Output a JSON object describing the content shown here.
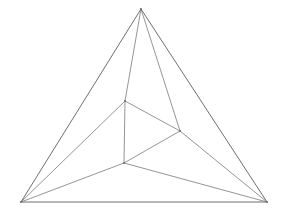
{
  "figure": {
    "type": "line-drawing",
    "background_color": "#ffffff",
    "canvas": {
      "width": 283,
      "height": 213
    },
    "stroke": {
      "color": "#6e6e6e",
      "outer_color": "#5f5f5f",
      "inner_color": "#7a7a7a",
      "width_outer": 0.9,
      "width_inner": 0.8
    },
    "vertices": [
      {
        "id": "apex",
        "name": "outer-apex",
        "x": 141,
        "y": 9
      },
      {
        "id": "bottom_left",
        "name": "outer-bottom-left",
        "x": 21,
        "y": 202
      },
      {
        "id": "bottom_right",
        "name": "outer-bottom-right",
        "x": 267,
        "y": 202
      },
      {
        "id": "inner_top",
        "name": "inner-top",
        "x": 125,
        "y": 101
      },
      {
        "id": "inner_right",
        "name": "inner-right",
        "x": 180,
        "y": 131
      },
      {
        "id": "inner_bottom",
        "name": "inner-bottom",
        "x": 124,
        "y": 163
      }
    ],
    "edges": [
      {
        "id": "outer-left-side",
        "from": "apex",
        "to": "bottom_left",
        "group": "outer"
      },
      {
        "id": "outer-right-side",
        "from": "apex",
        "to": "bottom_right",
        "group": "outer"
      },
      {
        "id": "outer-base",
        "from": "bottom_left",
        "to": "bottom_right",
        "group": "outer"
      },
      {
        "id": "inner-top-right",
        "from": "inner_top",
        "to": "inner_right",
        "group": "inner"
      },
      {
        "id": "inner-right-bottom",
        "from": "inner_right",
        "to": "inner_bottom",
        "group": "inner"
      },
      {
        "id": "inner-bottom-top",
        "from": "inner_bottom",
        "to": "inner_top",
        "group": "inner"
      },
      {
        "id": "apex-to-inner-top",
        "from": "apex",
        "to": "inner_top",
        "group": "connector"
      },
      {
        "id": "apex-to-inner-right",
        "from": "apex",
        "to": "inner_right",
        "group": "connector"
      },
      {
        "id": "bl-to-inner-top",
        "from": "bottom_left",
        "to": "inner_top",
        "group": "connector"
      },
      {
        "id": "bl-to-inner-bottom",
        "from": "bottom_left",
        "to": "inner_bottom",
        "group": "connector"
      },
      {
        "id": "br-to-inner-right",
        "from": "bottom_right",
        "to": "inner_right",
        "group": "connector"
      },
      {
        "id": "br-to-inner-bottom",
        "from": "bottom_right",
        "to": "inner_bottom",
        "group": "connector"
      }
    ]
  }
}
